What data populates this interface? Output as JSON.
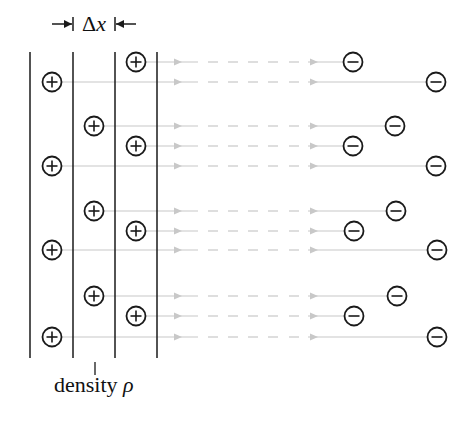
{
  "labels": {
    "delta": "Δ",
    "x": "x",
    "density": "density ",
    "rho": "ρ"
  },
  "colors": {
    "stroke": "#1a1a1a",
    "field_line": "#c8c8c8",
    "background": "#ffffff"
  },
  "layers": {
    "x_positions": [
      30,
      73,
      115,
      157
    ],
    "y_top": 52,
    "y_bottom": 358
  },
  "positive_charges": [
    {
      "x": 136,
      "y": 62
    },
    {
      "x": 52,
      "y": 82
    },
    {
      "x": 94,
      "y": 126
    },
    {
      "x": 136,
      "y": 146
    },
    {
      "x": 52,
      "y": 166
    },
    {
      "x": 94,
      "y": 211
    },
    {
      "x": 136,
      "y": 231
    },
    {
      "x": 52,
      "y": 250
    },
    {
      "x": 94,
      "y": 296
    },
    {
      "x": 136,
      "y": 316
    },
    {
      "x": 52,
      "y": 337
    }
  ],
  "negative_charges": [
    {
      "x": 353,
      "y": 62
    },
    {
      "x": 436,
      "y": 82
    },
    {
      "x": 395,
      "y": 126
    },
    {
      "x": 353,
      "y": 146
    },
    {
      "x": 436,
      "y": 166
    },
    {
      "x": 396,
      "y": 211
    },
    {
      "x": 354,
      "y": 231
    },
    {
      "x": 437,
      "y": 250
    },
    {
      "x": 397,
      "y": 296
    },
    {
      "x": 354,
      "y": 316
    },
    {
      "x": 437,
      "y": 337
    }
  ],
  "symbols": {
    "plus": "+",
    "minus": "−"
  }
}
